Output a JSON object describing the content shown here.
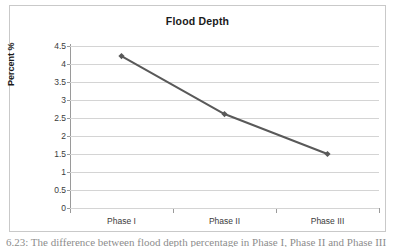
{
  "chart_data": {
    "type": "line",
    "title": "Flood Depth",
    "xlabel": "",
    "ylabel": "Percent %",
    "categories": [
      "Phase I",
      "Phase II",
      "Phase III"
    ],
    "values": [
      4.22,
      2.61,
      1.5
    ],
    "series": [
      {
        "name": "Flood Depth",
        "values": [
          4.22,
          2.61,
          1.5
        ],
        "color": "#595959",
        "marker": "diamond"
      }
    ],
    "ylim": [
      0,
      4.5
    ],
    "ytick_step": 0.5,
    "yticks": [
      "4.5",
      "4",
      "3.5",
      "3",
      "2.5",
      "2",
      "1.5",
      "1",
      "0.5",
      "0"
    ],
    "ytick_values": [
      4.5,
      4,
      3.5,
      3,
      2.5,
      2,
      1.5,
      1,
      0.5,
      0
    ],
    "grid": true,
    "grid_axis": "y",
    "legend": false,
    "legend_position": "none",
    "plot_background": "#ffffff",
    "grid_color": "#d4d4d4",
    "axis_color": "#9a9a9a",
    "border_color": "#c9c9c9"
  },
  "caption": {
    "text": "6.23:  The difference between flood depth percentage in Phase I, Phase II and Phase III"
  }
}
